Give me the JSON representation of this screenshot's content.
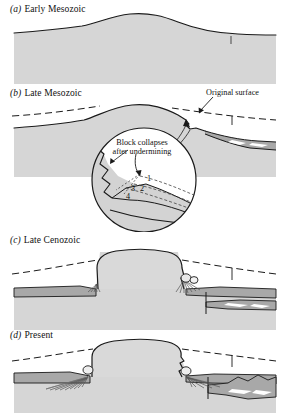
{
  "figure": {
    "type": "geological-cross-section-sequence"
  },
  "palette": {
    "background": "#ffffff",
    "bedrock_fill": "#d6d6d6",
    "caprock_fill": "#d9d9d9",
    "sediment_fill": "#a8a8a8",
    "outline": "#1a1a1a",
    "dash_line": "#1a1a1a",
    "inset_fill": "#d3d3d3",
    "white_lens": "#ffffff"
  },
  "panels": [
    {
      "id": "a",
      "letter": "(a)",
      "title": "Early Mesozoic",
      "label_x": 10,
      "label_y": 6
    },
    {
      "id": "b",
      "letter": "(b)",
      "title": "Late Mesozoic",
      "label_x": 10,
      "label_y": 90
    },
    {
      "id": "c",
      "letter": "(c)",
      "title": "Late Cenozoic",
      "label_x": 10,
      "label_y": 237
    },
    {
      "id": "d",
      "letter": "(d)",
      "title": "Present",
      "label_x": 10,
      "label_y": 332
    }
  ],
  "annotations": {
    "original_surface": {
      "text": "Original surface",
      "x": 208,
      "y": 90
    },
    "block_collapse": {
      "line1": "Block collapses",
      "line2": "after undermining",
      "x": 108,
      "y": 140
    }
  },
  "inset": {
    "name": "magnified-detail-circle",
    "center_x": 144,
    "center_y": 180,
    "radius": 52,
    "stage_numbers": [
      "1",
      "2",
      "3",
      "4"
    ],
    "stage_positions": [
      {
        "label": "1",
        "x": 148,
        "y": 180
      },
      {
        "label": "2",
        "x": 141,
        "y": 190
      },
      {
        "label": "3",
        "x": 133,
        "y": 190
      },
      {
        "label": "4",
        "x": 128,
        "y": 197
      }
    ]
  }
}
